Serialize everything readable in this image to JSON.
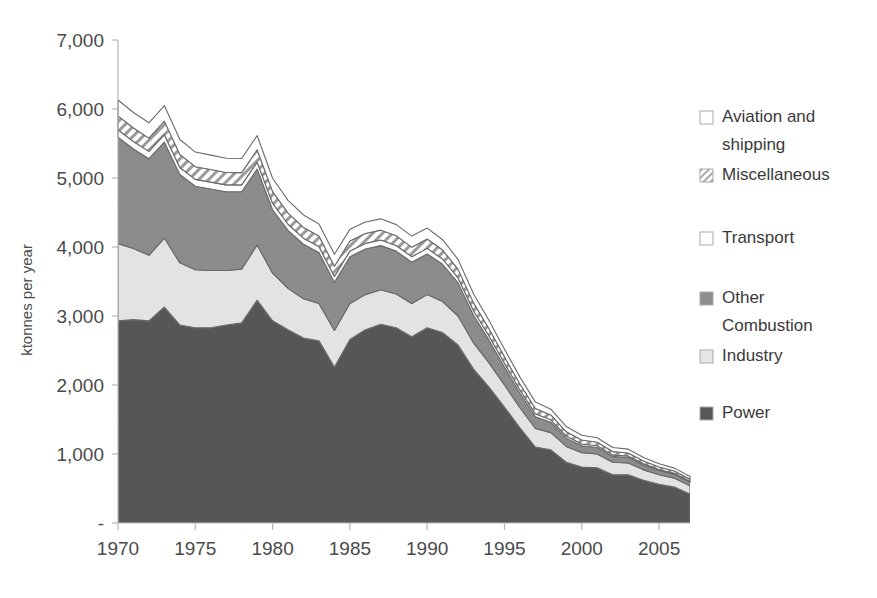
{
  "chart_data": {
    "type": "area",
    "stacked": true,
    "title": "",
    "xlabel": "",
    "ylabel": "ktonnes per year",
    "xlim": [
      1970,
      2007
    ],
    "ylim": [
      0,
      7000
    ],
    "grid": false,
    "legend_position": "right",
    "x": [
      1970,
      1971,
      1972,
      1973,
      1974,
      1975,
      1976,
      1977,
      1978,
      1979,
      1980,
      1981,
      1982,
      1983,
      1984,
      1985,
      1986,
      1987,
      1988,
      1989,
      1990,
      1991,
      1992,
      1993,
      1994,
      1995,
      1996,
      1997,
      1998,
      1999,
      2000,
      2001,
      2002,
      2003,
      2004,
      2005,
      2006,
      2007
    ],
    "xticks": [
      1970,
      1975,
      1980,
      1985,
      1990,
      1995,
      2000,
      2005
    ],
    "xtick_labels": [
      "1970",
      "1975",
      "1980",
      "1985",
      "1990",
      "1995",
      "2000",
      "2005"
    ],
    "yticks": [
      0,
      1000,
      2000,
      3000,
      4000,
      5000,
      6000,
      7000
    ],
    "ytick_labels": [
      "-",
      "1,000",
      "2,000",
      "3,000",
      "4,000",
      "5,000",
      "6,000",
      "7,000"
    ],
    "series": [
      {
        "name": "Power",
        "color": "#585858",
        "pattern": "solid",
        "values": [
          2930,
          2950,
          2930,
          3130,
          2870,
          2830,
          2830,
          2870,
          2900,
          3230,
          2930,
          2800,
          2680,
          2640,
          2260,
          2660,
          2800,
          2880,
          2830,
          2700,
          2830,
          2760,
          2580,
          2230,
          1970,
          1680,
          1380,
          1100,
          1060,
          880,
          810,
          800,
          700,
          700,
          620,
          560,
          520,
          420
        ]
      },
      {
        "name": "Industry",
        "color": "#e6e6e6",
        "pattern": "solid",
        "values": [
          1120,
          1030,
          950,
          1000,
          900,
          840,
          830,
          790,
          780,
          800,
          690,
          600,
          570,
          540,
          530,
          520,
          510,
          500,
          490,
          480,
          480,
          450,
          420,
          380,
          350,
          320,
          290,
          270,
          250,
          230,
          210,
          200,
          180,
          170,
          150,
          140,
          130,
          120
        ]
      },
      {
        "name": "Other Combustion",
        "color": "#8e8e8e",
        "pattern": "solid",
        "values": [
          1540,
          1440,
          1400,
          1390,
          1280,
          1210,
          1180,
          1140,
          1120,
          1100,
          920,
          840,
          790,
          740,
          700,
          680,
          660,
          640,
          620,
          600,
          590,
          540,
          480,
          400,
          330,
          260,
          210,
          170,
          150,
          120,
          100,
          95,
          85,
          80,
          70,
          60,
          55,
          50
        ]
      },
      {
        "name": "Transport",
        "color": "#fdfdfd",
        "pattern": "solid",
        "values": [
          110,
          108,
          106,
          108,
          102,
          100,
          100,
          100,
          100,
          100,
          95,
          90,
          88,
          86,
          84,
          82,
          82,
          82,
          82,
          80,
          80,
          76,
          72,
          66,
          60,
          54,
          48,
          42,
          36,
          30,
          26,
          24,
          22,
          20,
          18,
          16,
          15,
          14
        ]
      },
      {
        "name": "Miscellaneous",
        "color": "#ffffff",
        "pattern": "diagonal-hatch",
        "values": [
          200,
          196,
          192,
          196,
          188,
          184,
          182,
          180,
          178,
          180,
          168,
          160,
          156,
          152,
          148,
          146,
          144,
          142,
          140,
          138,
          136,
          130,
          124,
          114,
          104,
          94,
          86,
          78,
          70,
          62,
          56,
          52,
          48,
          44,
          40,
          36,
          33,
          30
        ]
      },
      {
        "name": "Aviation and shipping",
        "color": "#ffffff",
        "pattern": "solid",
        "values": [
          230,
          226,
          222,
          226,
          218,
          212,
          210,
          206,
          204,
          206,
          194,
          186,
          180,
          176,
          172,
          168,
          166,
          164,
          162,
          160,
          158,
          150,
          142,
          130,
          120,
          110,
          100,
          92,
          84,
          76,
          70,
          64,
          60,
          56,
          50,
          46,
          42,
          40
        ]
      }
    ]
  },
  "legend": {
    "items": [
      {
        "label": "Aviation and shipping",
        "swatch": "open-square",
        "color": "#ffffff"
      },
      {
        "label": "Miscellaneous",
        "swatch": "hatched-square",
        "color": "#ffffff"
      },
      {
        "label": "Transport",
        "swatch": "open-square",
        "color": "#fdfdfd"
      },
      {
        "label": "Other Combustion",
        "swatch": "filled-square",
        "color": "#8e8e8e"
      },
      {
        "label": "Industry",
        "swatch": "filled-square",
        "color": "#e6e6e6"
      },
      {
        "label": "Power",
        "swatch": "filled-square",
        "color": "#585858"
      }
    ]
  },
  "axes": {
    "y_axis_title": "ktonnes per year"
  }
}
